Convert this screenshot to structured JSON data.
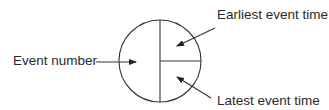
{
  "diagram": {
    "node": {
      "shape": "circle",
      "sections": [
        {
          "id": "left",
          "meaning": "Event number"
        },
        {
          "id": "top-right",
          "meaning": "Earliest event time"
        },
        {
          "id": "bottom-right",
          "meaning": "Latest event time"
        }
      ]
    },
    "labels": {
      "event_number": "Event number",
      "earliest_event_time": "Earliest event time",
      "latest_event_time": "Latest event time"
    },
    "colors": {
      "line": "#333333",
      "text": "#2a2a2a",
      "background": "#ffffff"
    }
  }
}
